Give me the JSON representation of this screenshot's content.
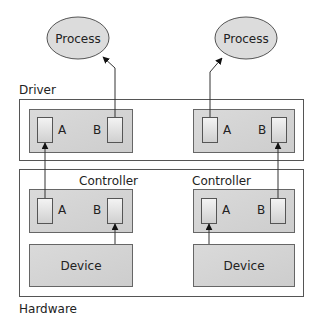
{
  "layers": {
    "driver_label": "Driver",
    "hardware_label": "Hardware"
  },
  "processes": [
    {
      "label": "Process"
    },
    {
      "label": "Process"
    }
  ],
  "drivers": [
    {
      "port_a": "A",
      "port_b": "B"
    },
    {
      "port_a": "A",
      "port_b": "B"
    }
  ],
  "controllers": [
    {
      "label": "Controller",
      "port_a": "A",
      "port_b": "B"
    },
    {
      "label": "Controller",
      "port_a": "A",
      "port_b": "B"
    }
  ],
  "devices": [
    {
      "label": "Device"
    },
    {
      "label": "Device"
    }
  ],
  "colors": {
    "box_fill": "#d6d6d6",
    "ellipse_fill": "#dcdcdc",
    "port_fill": "#ececec",
    "stroke": "#555555"
  }
}
